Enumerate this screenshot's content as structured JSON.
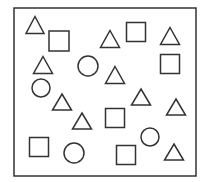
{
  "figure": {
    "stroke_color": "#333333",
    "background": "#ffffff",
    "frame": {
      "x": 14,
      "y": 8,
      "width": 182,
      "height": 168
    },
    "counts": {
      "triangles": 10,
      "squares": 6,
      "circles": 4
    },
    "shapes": [
      {
        "type": "triangle",
        "cx": 35,
        "cy": 25,
        "w": 18,
        "h": 17
      },
      {
        "type": "square",
        "cx": 59,
        "cy": 41,
        "size": 20
      },
      {
        "type": "triangle",
        "cx": 110,
        "cy": 39,
        "w": 19,
        "h": 17
      },
      {
        "type": "square",
        "cx": 136,
        "cy": 32,
        "size": 19
      },
      {
        "type": "triangle",
        "cx": 170,
        "cy": 36,
        "w": 19,
        "h": 17
      },
      {
        "type": "triangle",
        "cx": 43,
        "cy": 65,
        "w": 19,
        "h": 17
      },
      {
        "type": "circle",
        "cx": 88,
        "cy": 66,
        "r": 10
      },
      {
        "type": "square",
        "cx": 170,
        "cy": 64,
        "size": 19
      },
      {
        "type": "triangle",
        "cx": 115,
        "cy": 75,
        "w": 19,
        "h": 17
      },
      {
        "type": "circle",
        "cx": 41,
        "cy": 88,
        "r": 9
      },
      {
        "type": "triangle",
        "cx": 62,
        "cy": 102,
        "w": 19,
        "h": 16
      },
      {
        "type": "triangle",
        "cx": 141,
        "cy": 97,
        "w": 19,
        "h": 16
      },
      {
        "type": "triangle",
        "cx": 176,
        "cy": 107,
        "w": 19,
        "h": 16
      },
      {
        "type": "triangle",
        "cx": 82,
        "cy": 121,
        "w": 19,
        "h": 16
      },
      {
        "type": "square",
        "cx": 115,
        "cy": 118,
        "size": 19
      },
      {
        "type": "circle",
        "cx": 150,
        "cy": 137,
        "r": 9
      },
      {
        "type": "square",
        "cx": 39,
        "cy": 147,
        "size": 19
      },
      {
        "type": "circle",
        "cx": 74,
        "cy": 153,
        "r": 10
      },
      {
        "type": "square",
        "cx": 126,
        "cy": 155,
        "size": 19
      },
      {
        "type": "triangle",
        "cx": 174,
        "cy": 152,
        "w": 19,
        "h": 16
      }
    ]
  }
}
